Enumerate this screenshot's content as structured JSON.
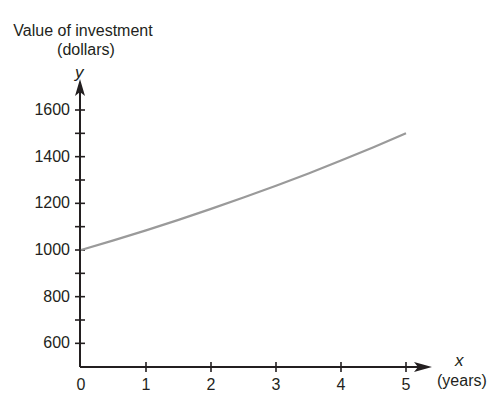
{
  "chart_data": {
    "type": "line",
    "title": "",
    "ylabel": "Value of investment (dollars)",
    "ylabel_line1": "Value of investment",
    "ylabel_line2": "(dollars)",
    "y_var": "y",
    "xlabel": "(years)",
    "x_var": "x",
    "xlim": [
      0,
      5
    ],
    "ylim": [
      500,
      1600
    ],
    "x_ticks": [
      0,
      1,
      2,
      3,
      4,
      5
    ],
    "y_ticks": [
      600,
      800,
      1000,
      1200,
      1400,
      1600
    ],
    "y_minor_ticks": [
      700,
      900,
      1100,
      1300,
      1500
    ],
    "grid": false,
    "series": [
      {
        "name": "Value of investment",
        "color": "#9a9a9a",
        "x": [
          0,
          0.5,
          1,
          1.5,
          2,
          2.5,
          3,
          3.5,
          4,
          4.5,
          5
        ],
        "values": [
          1000,
          1041,
          1084,
          1129,
          1176,
          1225,
          1275,
          1328,
          1383,
          1440,
          1500
        ]
      }
    ]
  },
  "labels": {
    "ylabel_line1": "Value of investment",
    "ylabel_line2": "(dollars)",
    "y_var": "y",
    "x_var": "x",
    "x_unit": "(years)",
    "y_ticks": [
      "600",
      "800",
      "1000",
      "1200",
      "1400",
      "1600"
    ],
    "x_ticks": [
      "0",
      "1",
      "2",
      "3",
      "4",
      "5"
    ]
  }
}
